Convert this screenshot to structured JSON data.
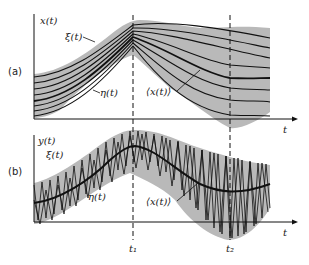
{
  "figure": {
    "panel_a": {
      "label": "(a)",
      "y_axis_label": "x(t)",
      "x_axis_label": "t",
      "upper_curve_label": "ξ(t)",
      "lower_curve_label": "η(t)",
      "mean_label": "⟨x(t)⟩"
    },
    "panel_b": {
      "label": "(b)",
      "y_axis_label": "y(t)",
      "x_axis_label": "t",
      "upper_curve_label": "ξ(t)",
      "lower_curve_label": "η(t)",
      "mean_label": "⟨x(t)⟩"
    },
    "time_markers": [
      "t₁",
      "t₂"
    ],
    "colors": {
      "band": "#b9b9b9",
      "line": "#111111",
      "background": "#ffffff"
    }
  }
}
